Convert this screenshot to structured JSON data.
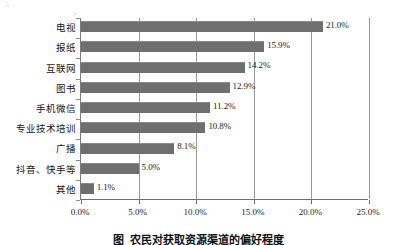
{
  "chart_data": {
    "type": "bar",
    "orientation": "horizontal",
    "title": "",
    "xlabel": "",
    "ylabel": "",
    "categories": [
      "电视",
      "报纸",
      "互联网",
      "图书",
      "手机微信",
      "专业技术培训",
      "广播",
      "抖音、快手等",
      "其他"
    ],
    "values": [
      21.0,
      15.9,
      14.2,
      12.9,
      11.2,
      10.8,
      8.1,
      5.0,
      1.1
    ],
    "value_labels": [
      "21.0%",
      "15.9%",
      "14.2%",
      "12.9%",
      "11.2%",
      "10.8%",
      "8.1%",
      "5.0%",
      "1.1%"
    ],
    "xlim": [
      0,
      25
    ],
    "xticks": [
      0,
      5,
      10,
      15,
      20,
      25
    ],
    "xtick_labels": [
      "0.0%",
      "5.0%",
      "10.0%",
      "15.0%",
      "20.0%",
      "25.0%"
    ],
    "grid": true,
    "grid_axis": "x",
    "legend": false,
    "bar_color": "#6f6f6f",
    "gridline_color": "#9a9a9a",
    "axis_color": "#6e6e6e"
  },
  "caption": {
    "prefix": "图",
    "number": "",
    "text": "农民对获取资源渠道的偏好程度"
  }
}
